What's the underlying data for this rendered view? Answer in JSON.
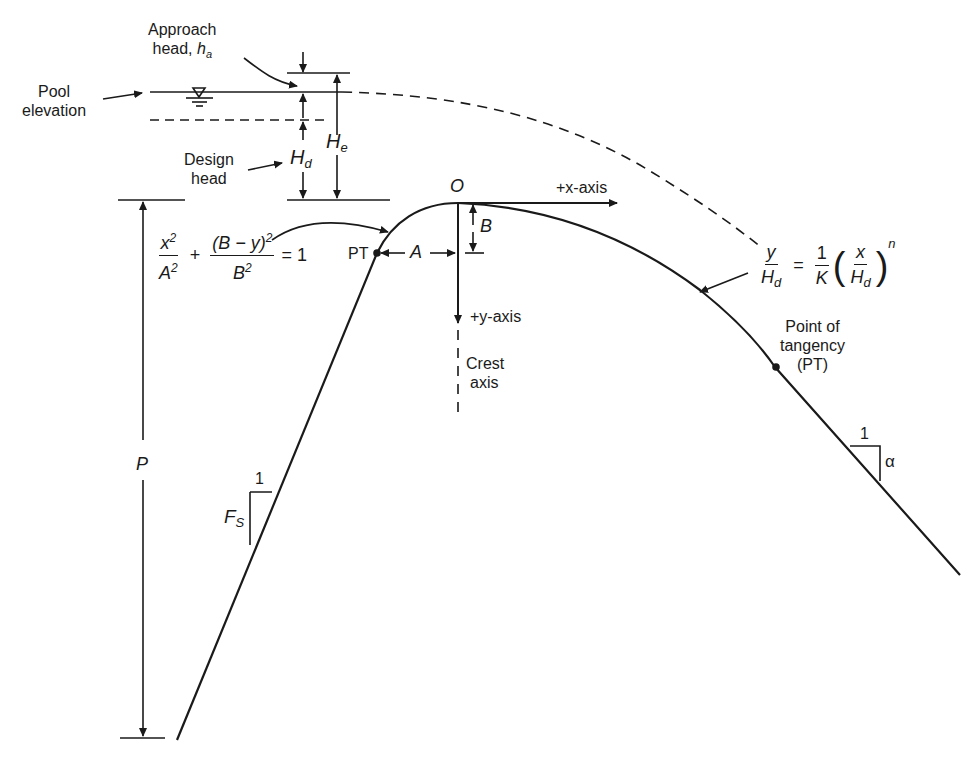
{
  "figure": {
    "labels": {
      "approach_head_line1": "Approach",
      "approach_head_line2": "head,",
      "approach_head_symbol": "h",
      "approach_head_sub": "a",
      "pool_line1": "Pool",
      "pool_line2": "elevation",
      "design_line1": "Design",
      "design_line2": "head",
      "Hd_symbol": "H",
      "Hd_sub": "d",
      "He_symbol": "H",
      "He_sub": "e",
      "origin": "O",
      "x_axis": "+x-axis",
      "y_axis": "+y-axis",
      "crest_line1": "Crest",
      "crest_line2": "axis",
      "B": "B",
      "A": "A",
      "PT_upstream": "PT",
      "P": "P",
      "Fs_symbol": "F",
      "Fs_sub": "S",
      "Fs_one": "1",
      "alpha_one": "1",
      "alpha": "α",
      "pt_down_line1": "Point of",
      "pt_down_line2": "tangency",
      "pt_down_line3": "(PT)"
    },
    "ellipse_equation": {
      "num1": "x",
      "num1_sup": "2",
      "den1": "A",
      "den1_sup": "2",
      "plus": "+",
      "num2": "(B − y)",
      "num2_sup": "2",
      "den2": "B",
      "den2_sup": "2",
      "equals": "= 1"
    },
    "power_equation": {
      "lhs_num": "y",
      "lhs_den": "H",
      "lhs_den_sub": "d",
      "equals": "=",
      "coef_num": "1",
      "coef_den": "K",
      "inner_num": "x",
      "inner_den": "H",
      "inner_den_sub": "d",
      "exponent": "n",
      "lparen": "(",
      "rparen": ")"
    },
    "colors": {
      "ink": "#1a1a1a",
      "background": "#ffffff"
    }
  }
}
